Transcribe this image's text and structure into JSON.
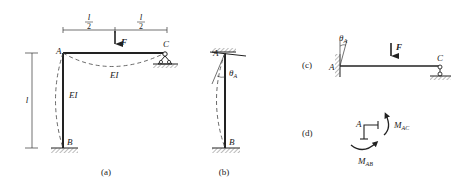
{
  "figure": {
    "panels": [
      {
        "caption": "(a)",
        "labels": {
          "A": "A",
          "B": "B",
          "C": "C",
          "F": "F",
          "EI_beam": "EI",
          "EI_column": "EI",
          "half_num_left": "l",
          "half_den_left": "2",
          "half_num_right": "l",
          "half_den_right": "2",
          "height": "l"
        }
      },
      {
        "caption": "(b)",
        "labels": {
          "A": "A",
          "B": "B",
          "theta": "θ",
          "theta_sub": "A"
        }
      },
      {
        "caption": "(c)",
        "labels": {
          "A": "A",
          "C": "C",
          "F": "F",
          "theta": "θ",
          "theta_sub": "A"
        }
      },
      {
        "caption": "(d)",
        "labels": {
          "A": "A",
          "M_AC": "M",
          "M_AC_sub": "AC",
          "M_AB": "M",
          "M_AB_sub": "AB"
        }
      }
    ],
    "colors": {
      "line": "#222222",
      "hatch": "#555555",
      "dashed": "#444444"
    }
  }
}
